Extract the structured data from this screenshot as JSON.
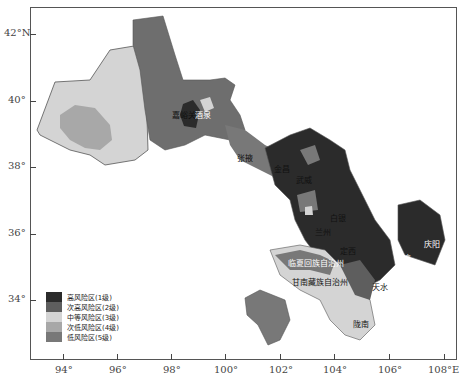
{
  "map": {
    "title": "Gansu risk zoning map",
    "y_axis_labels": [
      {
        "label": "42°N",
        "y": 34
      },
      {
        "label": "40°",
        "y": 101
      },
      {
        "label": "38°",
        "y": 167
      },
      {
        "label": "36°",
        "y": 234
      },
      {
        "label": "34°",
        "y": 300
      }
    ],
    "x_axis_labels": [
      {
        "label": "94°",
        "x": 63
      },
      {
        "label": "96°",
        "x": 117
      },
      {
        "label": "98°",
        "x": 171
      },
      {
        "label": "100°",
        "x": 225
      },
      {
        "label": "102°",
        "x": 280
      },
      {
        "label": "104°",
        "x": 334
      },
      {
        "label": "106°",
        "x": 389
      },
      {
        "label": "108°E",
        "x": 444
      }
    ],
    "places": [
      {
        "name": "嘉峪关",
        "x": 172,
        "y": 112
      },
      {
        "name": "酒泉",
        "x": 193,
        "y": 113
      },
      {
        "name": "张掖",
        "x": 238,
        "y": 152
      },
      {
        "name": "金昌",
        "x": 275,
        "y": 163
      },
      {
        "name": "武威",
        "x": 296,
        "y": 176
      },
      {
        "name": "白银",
        "x": 330,
        "y": 213
      },
      {
        "name": "兰州",
        "x": 317,
        "y": 228
      },
      {
        "name": "临夏回族自治州",
        "x": 290,
        "y": 257
      },
      {
        "name": "定西",
        "x": 340,
        "y": 247
      },
      {
        "name": "甘南藏族自治州",
        "x": 292,
        "y": 275
      },
      {
        "name": "陇南",
        "x": 355,
        "y": 318
      },
      {
        "name": "天水",
        "x": 373,
        "y": 282
      },
      {
        "name": "平凉",
        "x": 396,
        "y": 253
      },
      {
        "name": "庆阳",
        "x": 425,
        "y": 240
      }
    ]
  },
  "legend": {
    "items": [
      {
        "label": "高风险区(1级)",
        "color": "#2b2b2b"
      },
      {
        "label": "次高风险区(2级)",
        "color": "#5e5e5e"
      },
      {
        "label": "中等风险区(3级)",
        "color": "#d4d4d4"
      },
      {
        "label": "次低风险区(4级)",
        "color": "#a8a8a8"
      },
      {
        "label": "低风险区(5级)",
        "color": "#787878"
      }
    ]
  }
}
